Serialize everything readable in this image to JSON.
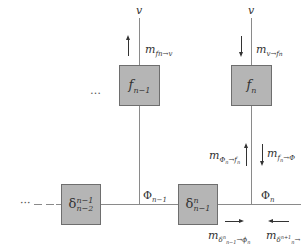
{
  "diagram": {
    "type": "factor-graph",
    "nodes": {
      "f_prev": {
        "label": "f",
        "sub": "n−1"
      },
      "f_curr": {
        "label": "f",
        "sub": "n"
      },
      "delta_prev": {
        "label": "δ",
        "sup": "n−1",
        "sub": "n−2"
      },
      "delta_curr": {
        "label": "δ",
        "sup": "n",
        "sub": "n−1"
      }
    },
    "variables": {
      "v_left": "v",
      "v_right": "v",
      "phi_prev": {
        "label": "Φ",
        "sub": "n−1"
      },
      "phi_curr": {
        "label": "Φ",
        "sub": "n"
      }
    },
    "messages": {
      "m_f_to_v": {
        "label": "m",
        "sub": "fn→v"
      },
      "m_v_to_f": {
        "label": "m",
        "sub": "v→f",
        "subsub": "n"
      },
      "m_phi_to_f": {
        "label": "m",
        "sub": "Φ",
        "subsub": "n",
        "sub2": "→f",
        "subsub2": "n"
      },
      "m_f_to_phi": {
        "label": "m",
        "sub": "f",
        "subsub": "n",
        "sub2": "→Φ"
      },
      "m_delta_to_phi": {
        "label": "m",
        "sub": "δ",
        "subsup": "n",
        "subsub": "n−1",
        "sub2": "→ϕ",
        "subsub2": "n"
      },
      "m_delta_next": {
        "label": "m",
        "sub": "δ",
        "subsup": "n+1",
        "subsub": "n",
        "sub2": "→"
      }
    },
    "ellipsis_top": "…",
    "ellipsis_left": "···"
  }
}
